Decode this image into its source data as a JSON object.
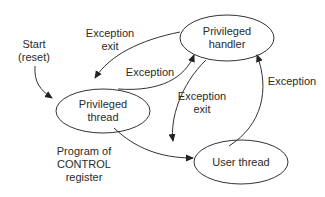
{
  "diagram": {
    "type": "state-diagram",
    "colors": {
      "stroke": "#333333",
      "text": "#2a2a2a",
      "background": "#ffffff"
    },
    "states": [
      {
        "id": "privileged_handler",
        "label": "Privileged\nhandler"
      },
      {
        "id": "privileged_thread",
        "label": "Privileged\nthread"
      },
      {
        "id": "user_thread",
        "label": "User thread"
      }
    ],
    "start": {
      "label": "Start\n(reset)",
      "target": "privileged_thread"
    },
    "transitions": [
      {
        "from": "privileged_handler",
        "to": "privileged_thread",
        "label": "Exception\nexit"
      },
      {
        "from": "privileged_thread",
        "to": "privileged_handler",
        "label": "Exception"
      },
      {
        "from": "privileged_handler",
        "to": "user_thread",
        "label": "Exception\nexit"
      },
      {
        "from": "user_thread",
        "to": "privileged_handler",
        "label": "Exception"
      },
      {
        "from": "privileged_thread",
        "to": "user_thread",
        "label": "Program of\nCONTROL\nregister"
      }
    ]
  }
}
